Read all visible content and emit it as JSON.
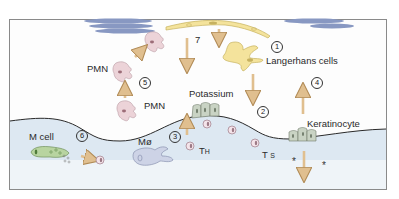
{
  "diagram": {
    "colors": {
      "frame": "#8a8a8a",
      "background": "#fdfdfd",
      "lower_region": "#dde8f2",
      "membrane_line": "#2a2a2a",
      "arrow": "#e0bf8f",
      "arrow_outline": "#b08a55",
      "langerhans": "#f4e39c",
      "pmn": "#ecd3d8",
      "macrophage": "#cdd3e6",
      "m_cell": "#b8d4a0",
      "keratinocyte": "#c9d3c4",
      "lymphocyte": "#f4e4ea",
      "vessel": "#8898c2"
    },
    "labels": {
      "langerhans": "Langerhans cells",
      "potassium": "Potassium",
      "pmn_top": "PMN",
      "pmn_mid": "PMN",
      "keratinocyte": "Keratinocyte",
      "m_cell": "M cell",
      "macrophage": "Mø",
      "th_main": "T",
      "th_sub": "H",
      "ts_main": "T",
      "ts_sub": "S",
      "seven": "7",
      "star": "*"
    },
    "steps": [
      "1",
      "2",
      "3",
      "4",
      "5",
      "6"
    ]
  }
}
